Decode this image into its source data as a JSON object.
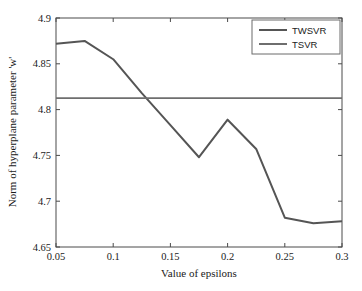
{
  "chart_data": {
    "type": "line",
    "title": "",
    "xlabel": "Value of epsilons",
    "ylabel": "Norm of hyperplane parameter 'w'",
    "xlim": [
      0.05,
      0.3
    ],
    "ylim": [
      4.65,
      4.9
    ],
    "xticks": [
      "0.05",
      "0.1",
      "0.15",
      "0.2",
      "0.25",
      "0.3"
    ],
    "xtick_values": [
      0.05,
      0.1,
      0.15,
      0.2,
      0.25,
      0.3
    ],
    "yticks": [
      "4.65",
      "4.7",
      "4.75",
      "4.8",
      "4.85",
      "4.9"
    ],
    "ytick_values": [
      4.65,
      4.7,
      4.75,
      4.8,
      4.85,
      4.9
    ],
    "grid": false,
    "legend_position": "top-right",
    "x": [
      0.05,
      0.075,
      0.1,
      0.125,
      0.15,
      0.175,
      0.2,
      0.225,
      0.25,
      0.275,
      0.3
    ],
    "series": [
      {
        "name": "TWSVR",
        "color": "#555555",
        "values": [
          4.872,
          4.875,
          4.855,
          4.818,
          4.783,
          4.748,
          4.789,
          4.757,
          4.682,
          4.676,
          4.678
        ]
      },
      {
        "name": "TSVR",
        "color": "#6e6e6e",
        "constant": 4.8125,
        "values": [
          4.8125,
          4.8125,
          4.8125,
          4.8125,
          4.8125,
          4.8125,
          4.8125,
          4.8125,
          4.8125,
          4.8125,
          4.8125
        ]
      }
    ]
  },
  "legend": {
    "entries": [
      {
        "label": "TWSVR"
      },
      {
        "label": "TSVR"
      }
    ]
  }
}
